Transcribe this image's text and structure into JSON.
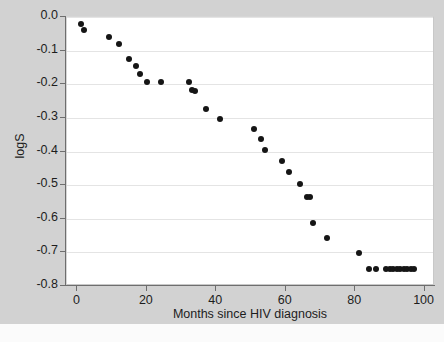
{
  "chart_data": {
    "type": "scatter",
    "title": "",
    "xlabel": "Months since HIV diagnosis",
    "ylabel": "logS",
    "xlim": [
      -3,
      103
    ],
    "ylim": [
      -0.8,
      0.0
    ],
    "xticks": [
      "0",
      "20",
      "40",
      "60",
      "80",
      "100"
    ],
    "xtick_values": [
      0,
      20,
      40,
      60,
      80,
      100
    ],
    "yticks": [
      "0.0",
      "-0.1",
      "-0.2",
      "-0.3",
      "-0.4",
      "-0.5",
      "-0.6",
      "-0.7",
      "-0.8"
    ],
    "ytick_values": [
      0.0,
      -0.1,
      -0.2,
      -0.3,
      -0.4,
      -0.5,
      -0.6,
      -0.7,
      -0.8
    ],
    "grid": "horizontal",
    "legend": "none",
    "marker": "filled-circle",
    "marker_color": "#151515",
    "plot_background": "#ffffff",
    "figure_background": "#d2d2d2",
    "points": [
      {
        "x": 1,
        "y": -0.02
      },
      {
        "x": 2,
        "y": -0.039
      },
      {
        "x": 9,
        "y": -0.06
      },
      {
        "x": 12,
        "y": -0.081
      },
      {
        "x": 15,
        "y": -0.126
      },
      {
        "x": 17,
        "y": -0.147
      },
      {
        "x": 18,
        "y": -0.17
      },
      {
        "x": 20,
        "y": -0.194
      },
      {
        "x": 24,
        "y": -0.194
      },
      {
        "x": 32,
        "y": -0.194
      },
      {
        "x": 33,
        "y": -0.218
      },
      {
        "x": 34,
        "y": -0.219
      },
      {
        "x": 37,
        "y": -0.274
      },
      {
        "x": 41,
        "y": -0.302
      },
      {
        "x": 51,
        "y": -0.334
      },
      {
        "x": 53,
        "y": -0.364
      },
      {
        "x": 54,
        "y": -0.395
      },
      {
        "x": 59,
        "y": -0.428
      },
      {
        "x": 61,
        "y": -0.462
      },
      {
        "x": 64,
        "y": -0.497
      },
      {
        "x": 66,
        "y": -0.534
      },
      {
        "x": 67,
        "y": -0.535
      },
      {
        "x": 68,
        "y": -0.614
      },
      {
        "x": 72,
        "y": -0.656
      },
      {
        "x": 81,
        "y": -0.701
      },
      {
        "x": 84,
        "y": -0.75
      },
      {
        "x": 86,
        "y": -0.75
      },
      {
        "x": 89,
        "y": -0.75
      },
      {
        "x": 90,
        "y": -0.75
      },
      {
        "x": 91,
        "y": -0.75
      },
      {
        "x": 92,
        "y": -0.75
      },
      {
        "x": 93,
        "y": -0.75
      },
      {
        "x": 94,
        "y": -0.75
      },
      {
        "x": 95,
        "y": -0.75
      },
      {
        "x": 96,
        "y": -0.75
      },
      {
        "x": 97,
        "y": -0.75
      }
    ]
  }
}
